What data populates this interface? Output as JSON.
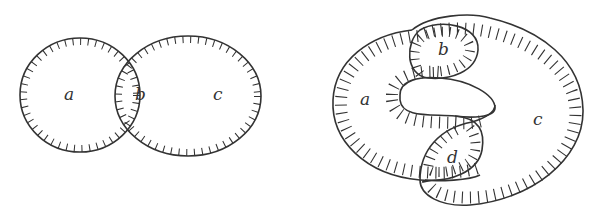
{
  "figures": [
    {
      "name": "left-venn",
      "regions": [
        {
          "label": "a"
        },
        {
          "label": "b"
        },
        {
          "label": "c"
        }
      ]
    },
    {
      "name": "right-knot",
      "regions": [
        {
          "label": "a"
        },
        {
          "label": "b"
        },
        {
          "label": "c"
        },
        {
          "label": "d"
        }
      ]
    }
  ],
  "colors": {
    "stroke": "#333333",
    "background": "#ffffff"
  }
}
